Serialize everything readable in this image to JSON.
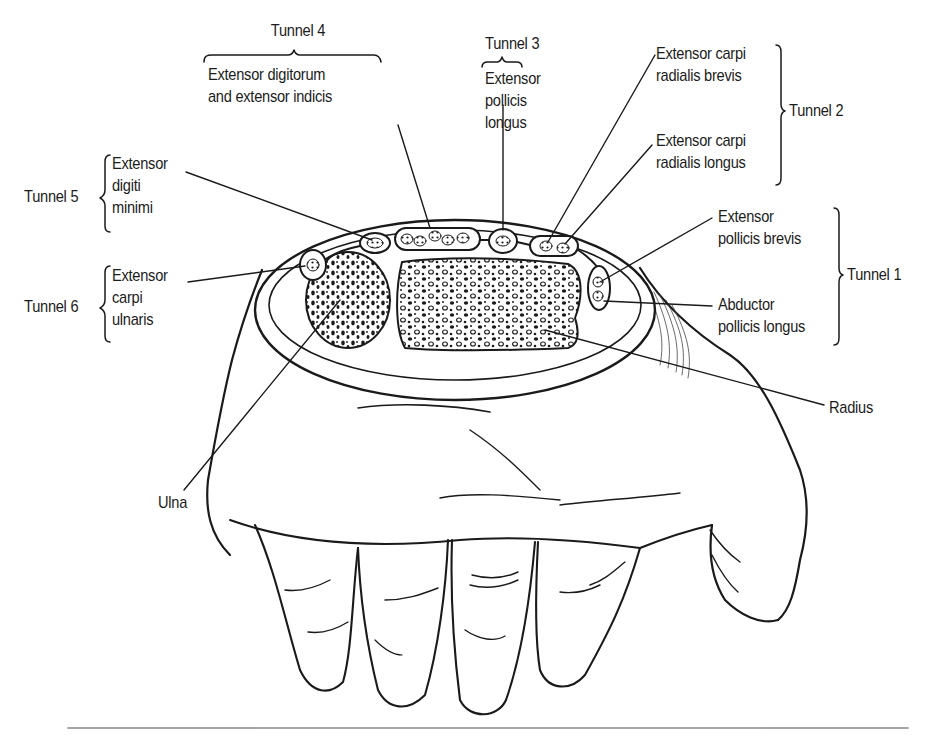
{
  "figure": {
    "type": "anatomical-diagram",
    "colors": {
      "ink": "#1a1a1a",
      "background": "#ffffff",
      "rule": "#888888"
    }
  },
  "tunnels": [
    {
      "id": "tunnel-1",
      "label": "Tunnel 1",
      "muscles": [
        {
          "lines": [
            "Extensor",
            "pollicis brevis"
          ]
        },
        {
          "lines": [
            "Abductor",
            "pollicis longus"
          ]
        }
      ]
    },
    {
      "id": "tunnel-2",
      "label": "Tunnel 2",
      "muscles": [
        {
          "lines": [
            "Extensor carpi",
            "radialis brevis"
          ]
        },
        {
          "lines": [
            "Extensor carpi",
            "radialis longus"
          ]
        }
      ]
    },
    {
      "id": "tunnel-3",
      "label": "Tunnel 3",
      "muscles": [
        {
          "lines": [
            "Extensor",
            "pollicis",
            "longus"
          ]
        }
      ]
    },
    {
      "id": "tunnel-4",
      "label": "Tunnel 4",
      "muscles": [
        {
          "lines": [
            "Extensor digitorum",
            "and extensor indicis"
          ]
        }
      ]
    },
    {
      "id": "tunnel-5",
      "label": "Tunnel 5",
      "muscles": [
        {
          "lines": [
            "Extensor",
            "digiti",
            "minimi"
          ]
        }
      ]
    },
    {
      "id": "tunnel-6",
      "label": "Tunnel 6",
      "muscles": [
        {
          "lines": [
            "Extensor",
            "carpi",
            "ulnaris"
          ]
        }
      ]
    }
  ],
  "bones": [
    {
      "id": "radius",
      "label": "Radius"
    },
    {
      "id": "ulna",
      "label": "Ulna"
    }
  ]
}
